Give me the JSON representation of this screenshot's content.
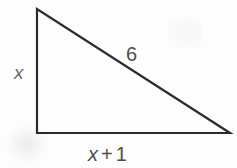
{
  "figure": {
    "kind": "right-triangle-diagram",
    "background_color": "#fdfdfd",
    "stroke_color": "#2b2b2b",
    "stroke_width": 2.2,
    "canvas": {
      "width": 237,
      "height": 168
    },
    "vertices": {
      "apex": {
        "x": 37,
        "y": 9
      },
      "bottom_left": {
        "x": 37,
        "y": 133
      },
      "bottom_right": {
        "x": 230,
        "y": 133
      }
    },
    "labels": {
      "vertical_leg": {
        "text": "x",
        "color": "#6b6b6b",
        "style": "italic"
      },
      "hypotenuse": {
        "text": "6",
        "color": "#4d4d4d",
        "style": "normal"
      },
      "base_leg": {
        "variable": "x",
        "operator": "+",
        "constant": "1",
        "color": "#4d4d4d"
      }
    }
  },
  "chart_data": {
    "type": "diagram",
    "title": "",
    "shape": "right triangle",
    "sides": [
      {
        "name": "vertical leg",
        "label": "x",
        "from": "apex",
        "to": "bottom_left",
        "pixel_length": 124
      },
      {
        "name": "base leg",
        "label": "x + 1",
        "from": "bottom_left",
        "to": "bottom_right",
        "pixel_length": 193
      },
      {
        "name": "hypotenuse",
        "label": "6",
        "from": "apex",
        "to": "bottom_right",
        "pixel_length": 230
      }
    ],
    "right_angle_at": "bottom_left",
    "annotations": [
      "x",
      "6",
      "x + 1"
    ]
  }
}
